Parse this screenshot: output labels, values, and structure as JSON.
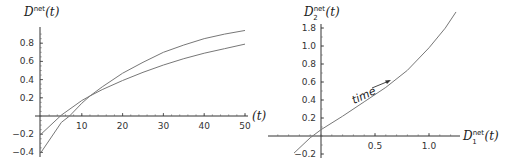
{
  "chart_data": [
    {
      "type": "line",
      "title": "",
      "ylabel": "D^net(t)",
      "ylabel_base": "D",
      "ylabel_sup": "net",
      "ylabel_arg": "(t)",
      "xlabel": "(t)",
      "xlim": [
        0,
        50
      ],
      "ylim": [
        -0.4,
        1.0
      ],
      "x_ticks": [
        "10",
        "20",
        "30",
        "40",
        "50"
      ],
      "y_ticks": [
        "0.8",
        "0.6",
        "0.4",
        "0.2",
        "-0.2",
        "-0.4"
      ],
      "grid": false,
      "legend": null,
      "series": [
        {
          "name": "curve-1",
          "x": [
            0,
            5,
            10,
            12,
            15,
            20,
            25,
            30,
            35,
            40,
            45,
            50
          ],
          "y": [
            -0.2,
            0.01,
            0.17,
            0.22,
            0.29,
            0.39,
            0.48,
            0.56,
            0.63,
            0.69,
            0.74,
            0.79
          ]
        },
        {
          "name": "curve-2",
          "x": [
            0,
            5,
            7,
            10,
            12,
            15,
            20,
            25,
            30,
            35,
            40,
            45,
            50
          ],
          "y": [
            -0.4,
            -0.07,
            0.0,
            0.14,
            0.22,
            0.32,
            0.47,
            0.59,
            0.7,
            0.78,
            0.85,
            0.9,
            0.94
          ]
        }
      ]
    },
    {
      "type": "line",
      "title": "",
      "ylabel": "D_2^net(t)",
      "ylabel_base": "D",
      "ylabel_sub": "2",
      "ylabel_sup": "net",
      "ylabel_arg": "(t)",
      "xlabel": "D_1^net(t)",
      "xlabel_base": "D",
      "xlabel_sub": "1",
      "xlabel_sup": "net",
      "xlabel_arg": "(t)",
      "xlim": [
        -0.25,
        1.25
      ],
      "ylim": [
        -0.2,
        1.8
      ],
      "x_ticks": [
        "0.5",
        "1.0"
      ],
      "y_ticks": [
        "1.8",
        "1.0",
        "0.8",
        "0.6",
        "0.4",
        "0.2",
        "-0.2"
      ],
      "grid": false,
      "legend": null,
      "annotations": [
        {
          "text": "time",
          "arrow": "along curve, increasing"
        }
      ],
      "series": [
        {
          "name": "parametric-curve",
          "x": [
            -0.25,
            -0.1,
            0.0,
            0.2,
            0.4,
            0.6,
            0.8,
            1.0,
            1.15,
            1.25
          ],
          "y": [
            -0.19,
            -0.02,
            0.07,
            0.22,
            0.38,
            0.54,
            0.73,
            0.98,
            1.22,
            1.42
          ]
        }
      ]
    }
  ]
}
